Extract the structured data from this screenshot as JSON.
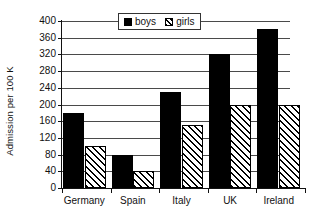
{
  "chart_data": {
    "type": "bar",
    "title": "",
    "xlabel": "",
    "ylabel": "Admission per 100 K",
    "categories": [
      "Germany",
      "Spain",
      "Italy",
      "UK",
      "Ireland"
    ],
    "series": [
      {
        "name": "boys",
        "values": [
          180,
          80,
          230,
          320,
          380
        ]
      },
      {
        "name": "girls",
        "values": [
          100,
          40,
          150,
          200,
          200
        ]
      }
    ],
    "ylim": [
      0,
      400
    ],
    "yticks": [
      0,
      40,
      80,
      120,
      160,
      200,
      240,
      280,
      320,
      360,
      400
    ],
    "grid": "horizontal",
    "legend_position": "top-center",
    "colors": {
      "boys": "#000000",
      "girls_fill": "#ffffff",
      "girls_hatch": "#000000",
      "axis": "#111111",
      "gridline": "#4a4a4a",
      "background": "#ffffff"
    }
  },
  "legend": {
    "entries": [
      {
        "label": "boys",
        "swatch": "solid-black-square"
      },
      {
        "label": "girls",
        "swatch": "hatched-square"
      }
    ]
  }
}
